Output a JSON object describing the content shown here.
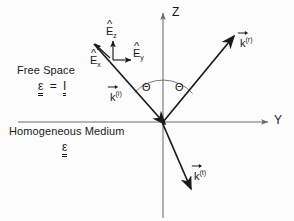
{
  "figure": {
    "background_color": "#fcfcfc",
    "ink_color": "#1a1a1a",
    "axis_color": "#6b6b6b"
  },
  "axes": {
    "z_label": "Z",
    "y_label": "Y",
    "origin_label": ""
  },
  "media": {
    "upper": {
      "name": "Free Space",
      "permittivity_symbol": "ε",
      "equals": "=",
      "permittivity_value": "I"
    },
    "lower": {
      "name": "Homogeneous Medium",
      "permittivity_symbol": "ε"
    }
  },
  "unit_vectors": [
    {
      "id": "e-z",
      "symbol": "E",
      "subscript": "z",
      "accent": "hat",
      "label": "Êz"
    },
    {
      "id": "e-y",
      "symbol": "E",
      "subscript": "y",
      "accent": "hat",
      "label": "Êy"
    },
    {
      "id": "e-x",
      "symbol": "E",
      "subscript": "x",
      "accent": "hat",
      "label": "Êx"
    }
  ],
  "wave_vectors": [
    {
      "id": "k-incident",
      "symbol": "k",
      "superscript": "(i)",
      "accent": "vector"
    },
    {
      "id": "k-reflected",
      "symbol": "k",
      "superscript": "(r)",
      "accent": "vector"
    },
    {
      "id": "k-transmitted",
      "symbol": "k",
      "superscript": "(t)",
      "accent": "vector"
    }
  ],
  "angles": [
    {
      "id": "theta-incident",
      "symbol": "Θ"
    },
    {
      "id": "theta-reflected",
      "symbol": "Θ"
    }
  ]
}
